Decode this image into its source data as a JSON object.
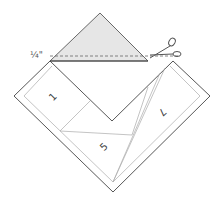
{
  "diagram": {
    "seam_allowance_label": "¼\"",
    "icons": {
      "scissors": "scissors-icon"
    },
    "patches": [
      {
        "id": "patch-1",
        "label": "1",
        "rotation": -45
      },
      {
        "id": "patch-5",
        "label": "5",
        "rotation": -45
      },
      {
        "id": "patch-7",
        "label": "7",
        "rotation": 135
      }
    ],
    "colors": {
      "outline": "#444444",
      "inner_line": "#aaaaaa",
      "shaded_triangle": "#e6e6e6",
      "dashed_line": "#666666"
    }
  }
}
